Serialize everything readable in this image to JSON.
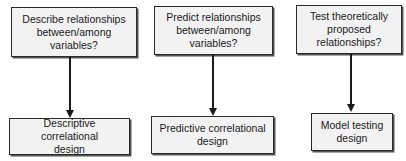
{
  "diagram": {
    "columns": [
      {
        "question": "Describe relationships between/among variables?",
        "question_lines": [
          "Describe relationships",
          "between/among",
          "variables?"
        ],
        "design": "Descriptive correlational design",
        "design_lines": [
          "Descriptive correlational",
          "design"
        ]
      },
      {
        "question": "Predict relationships between/among variables?",
        "question_lines": [
          "Predict relationships",
          "between/among",
          "variables?"
        ],
        "design": "Predictive correlational design",
        "design_lines": [
          "Predictive correlational",
          "design"
        ]
      },
      {
        "question": "Test theoretically proposed relationships?",
        "question_lines": [
          "Test theoretically",
          "proposed",
          "relationships?"
        ],
        "design": "Model testing design",
        "design_lines": [
          "Model testing",
          "design"
        ]
      }
    ],
    "colors": {
      "box_fill": "#f2f2f2",
      "border": "#2a2a2a",
      "arrow": "#1a1a1a"
    }
  }
}
